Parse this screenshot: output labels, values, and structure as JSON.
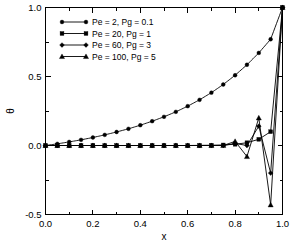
{
  "chart_data": {
    "type": "line",
    "title": "",
    "xlabel": "x",
    "ylabel": "θ",
    "xlim": [
      0.0,
      1.0
    ],
    "ylim": [
      -0.5,
      1.0
    ],
    "xticks": [
      "0.0",
      "0.2",
      "0.4",
      "0.6",
      "0.8",
      "1.0"
    ],
    "xtick_values": [
      0.0,
      0.2,
      0.4,
      0.6,
      0.8,
      1.0
    ],
    "yticks": [
      "-0.5",
      "0.0",
      "0.5",
      "1.0"
    ],
    "ytick_values": [
      -0.5,
      0.0,
      0.5,
      1.0
    ],
    "grid": false,
    "legend_position": "upper left",
    "minor_ticks": true,
    "x": [
      0.0,
      0.05,
      0.1,
      0.15,
      0.2,
      0.25,
      0.3,
      0.35,
      0.4,
      0.45,
      0.5,
      0.55,
      0.6,
      0.65,
      0.7,
      0.75,
      0.8,
      0.85,
      0.9,
      0.95,
      1.0
    ],
    "series": [
      {
        "name": "Pe = 2, Pg = 0.1",
        "marker": "circle",
        "values": [
          0.0,
          0.012,
          0.026,
          0.041,
          0.058,
          0.077,
          0.098,
          0.121,
          0.147,
          0.176,
          0.208,
          0.244,
          0.285,
          0.331,
          0.383,
          0.442,
          0.509,
          0.585,
          0.671,
          0.77,
          1.0
        ]
      },
      {
        "name": "Pe = 20, Pg = 1",
        "marker": "square",
        "values": [
          0.0,
          0.0,
          0.0,
          0.0,
          0.0,
          0.0,
          0.0,
          0.0,
          0.0,
          0.0,
          0.0,
          0.0,
          0.0,
          0.001,
          0.002,
          0.004,
          0.009,
          0.02,
          0.045,
          0.1,
          1.0
        ]
      },
      {
        "name": "Pe = 60, Pg = 3",
        "marker": "diamond",
        "values": [
          0.0,
          0.0,
          0.0,
          0.0,
          0.0,
          0.0,
          0.0,
          0.0,
          0.0,
          0.0,
          0.0,
          0.0,
          0.0,
          0.0,
          0.0,
          0.0,
          0.015,
          0.0,
          0.14,
          -0.2,
          1.0
        ]
      },
      {
        "name": "Pe = 100, Pg = 5",
        "marker": "triangle",
        "values": [
          0.0,
          0.0,
          0.0,
          0.0,
          0.0,
          0.0,
          0.0,
          0.0,
          0.0,
          0.0,
          0.0,
          0.0,
          0.0,
          0.0,
          0.0,
          0.0,
          0.03,
          -0.08,
          0.2,
          -0.43,
          1.0
        ]
      }
    ]
  },
  "legend": {
    "entries": [
      {
        "label": "Pe = 2, Pg = 0.1"
      },
      {
        "label": "Pe = 20, Pg = 1"
      },
      {
        "label": "Pe = 60, Pg = 3"
      },
      {
        "label": "Pe = 100, Pg = 5"
      }
    ]
  },
  "axes": {
    "x_title": "x",
    "y_title": "θ"
  }
}
